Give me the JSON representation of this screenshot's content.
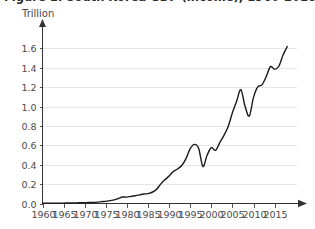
{
  "figure": {
    "title": "Figure 1: South Korea GDP (income), 1960-2018",
    "y_unit_label": "Trillion",
    "line_color": "#1a1a1a",
    "grid_color": "#e6e6e6",
    "axis_color": "#333333"
  },
  "chart_data": {
    "type": "line",
    "title": "Figure 1: South Korea GDP (income), 1960-2018",
    "xlabel": "",
    "ylabel": "Trillion",
    "xlim": [
      1960,
      2018
    ],
    "ylim": [
      0.0,
      1.7
    ],
    "grid": true,
    "legend": "none",
    "y_ticks": [
      "0.0",
      "0.2",
      "0.4",
      "0.6",
      "0.8",
      "1.0",
      "1.2",
      "1.4",
      "1.6"
    ],
    "y_tick_values": [
      0.0,
      0.2,
      0.4,
      0.6,
      0.8,
      1.0,
      1.2,
      1.4,
      1.6
    ],
    "x_ticks": [
      "1960",
      "1965",
      "1970",
      "1975",
      "1980",
      "1985",
      "1990",
      "1995",
      "2000",
      "2005",
      "2010",
      "2015"
    ],
    "x_tick_values": [
      1960,
      1965,
      1970,
      1975,
      1980,
      1985,
      1990,
      1995,
      2000,
      2005,
      2010,
      2015
    ],
    "series": [
      {
        "name": "South Korea GDP (income), trillion",
        "x": [
          1960,
          1961,
          1962,
          1963,
          1964,
          1965,
          1966,
          1967,
          1968,
          1969,
          1970,
          1971,
          1972,
          1973,
          1974,
          1975,
          1976,
          1977,
          1978,
          1979,
          1980,
          1981,
          1982,
          1983,
          1984,
          1985,
          1986,
          1987,
          1988,
          1989,
          1990,
          1991,
          1992,
          1993,
          1994,
          1995,
          1996,
          1997,
          1998,
          1999,
          2000,
          2001,
          2002,
          2003,
          2004,
          2005,
          2006,
          2007,
          2008,
          2009,
          2010,
          2011,
          2012,
          2013,
          2014,
          2015,
          2016,
          2017,
          2018
        ],
        "values": [
          0.004,
          0.003,
          0.003,
          0.004,
          0.004,
          0.004,
          0.005,
          0.005,
          0.006,
          0.008,
          0.009,
          0.01,
          0.011,
          0.014,
          0.019,
          0.022,
          0.03,
          0.038,
          0.052,
          0.067,
          0.066,
          0.074,
          0.08,
          0.089,
          0.098,
          0.102,
          0.116,
          0.144,
          0.2,
          0.244,
          0.283,
          0.33,
          0.356,
          0.392,
          0.463,
          0.566,
          0.61,
          0.57,
          0.383,
          0.497,
          0.576,
          0.548,
          0.627,
          0.703,
          0.794,
          0.935,
          1.053,
          1.173,
          1.002,
          0.902,
          1.094,
          1.203,
          1.223,
          1.306,
          1.411,
          1.383,
          1.415,
          1.53,
          1.619
        ]
      }
    ],
    "annotations": [
      {
        "label": "Asian Financial Crisis dip",
        "x": 1998,
        "y": 0.383
      },
      {
        "label": "Global Financial Crisis dip",
        "x": 2009,
        "y": 0.902
      }
    ]
  }
}
